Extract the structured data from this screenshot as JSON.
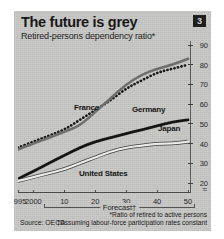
{
  "header": {
    "title": "The future is grey",
    "subtitle": "Retired-persons dependency ratio*",
    "badge": "3"
  },
  "source": "Source: OECD",
  "notes": {
    "note1": "*Ratio of retired to active persons",
    "note2": "†Assuming labour-force participation rates constant"
  },
  "forecast_label": "Forecast†",
  "colors": {
    "panel": "#c9c9c7",
    "france": "#121212",
    "germany": "#6e6e6e",
    "japan": "#101010",
    "united_states": "#f2f2f0",
    "axis": "#4a4a4a",
    "badge": "#1b1b1b"
  },
  "chart_data": {
    "type": "line",
    "title": "The future is grey",
    "subtitle": "Retired-persons dependency ratio*",
    "xlabel": "",
    "ylabel": "",
    "xlim": [
      1995,
      2050
    ],
    "ylim": [
      20,
      90
    ],
    "yticks": [
      90,
      80,
      70,
      60,
      50,
      40,
      30,
      20
    ],
    "y_axis_break": true,
    "xticks": [
      1995,
      2000,
      2010,
      2020,
      2030,
      2040,
      2050
    ],
    "xticklabels": [
      "1995",
      "2000",
      "10",
      "20",
      "30",
      "40",
      "50"
    ],
    "grid": false,
    "legend": "inline-labels",
    "forecast_from": 2001,
    "x": [
      1995,
      2000,
      2005,
      2010,
      2015,
      2020,
      2025,
      2030,
      2035,
      2040,
      2045,
      2050
    ],
    "series": [
      {
        "name": "France",
        "style": "dotted",
        "color": "#121212",
        "values": [
          38,
          41,
          44,
          47,
          52,
          57,
          62,
          68,
          72,
          76,
          78,
          80
        ]
      },
      {
        "name": "Germany",
        "style": "solid-grey",
        "color": "#6e6e6e",
        "values": [
          37,
          40,
          43,
          46,
          49,
          56,
          63,
          70,
          75,
          78,
          80,
          83
        ]
      },
      {
        "name": "Japan",
        "style": "solid-black",
        "color": "#101010",
        "values": [
          22,
          26,
          30,
          34,
          38,
          41,
          43,
          45,
          47,
          49,
          51,
          52
        ]
      },
      {
        "name": "United States",
        "style": "solid-white",
        "color": "#f2f2f0",
        "values": [
          21,
          23,
          25,
          27,
          30,
          33,
          36,
          38,
          39,
          40,
          40,
          41
        ]
      }
    ]
  }
}
